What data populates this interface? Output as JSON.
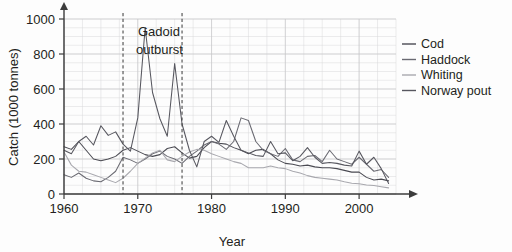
{
  "chart_data": {
    "type": "line",
    "title": "",
    "xlabel": "Year",
    "ylabel": "Catch (1000 tonnes)",
    "xlim": [
      1960,
      2005
    ],
    "ylim": [
      0,
      1000
    ],
    "grid": true,
    "legend_position": "right",
    "x_ticks": [
      "1960",
      "1970",
      "1980",
      "1990",
      "2000"
    ],
    "x_tick_values": [
      1960,
      1970,
      1980,
      1990,
      2000
    ],
    "y_ticks": [
      "0",
      "200",
      "400",
      "600",
      "800",
      "1000"
    ],
    "y_tick_values": [
      0,
      200,
      400,
      600,
      800,
      1000
    ],
    "annotations": [
      {
        "name": "gadoid-outburst",
        "text_line1": "Gadoid",
        "text_line2": "outburst",
        "span_start_year": 1968,
        "span_end_year": 1976,
        "style": "vertical dashed lines"
      }
    ],
    "x": [
      1960,
      1961,
      1962,
      1963,
      1964,
      1965,
      1966,
      1967,
      1968,
      1969,
      1970,
      1971,
      1972,
      1973,
      1974,
      1975,
      1976,
      1977,
      1978,
      1979,
      1980,
      1981,
      1982,
      1983,
      1984,
      1985,
      1986,
      1987,
      1988,
      1989,
      1990,
      1991,
      1992,
      1993,
      1994,
      1995,
      1996,
      1997,
      1998,
      1999,
      2000,
      2001,
      2002,
      2003,
      2004
    ],
    "series": [
      {
        "name": "Cod",
        "color": "#4a4a52",
        "values": [
          270,
          255,
          300,
          250,
          200,
          190,
          200,
          215,
          250,
          265,
          245,
          225,
          215,
          225,
          260,
          270,
          235,
          205,
          215,
          265,
          300,
          290,
          285,
          265,
          250,
          230,
          250,
          255,
          230,
          195,
          175,
          170,
          160,
          165,
          155,
          150,
          150,
          145,
          135,
          125,
          125,
          95,
          80,
          85,
          75
        ]
      },
      {
        "name": "Haddock",
        "color": "#6a6a72",
        "values": [
          110,
          95,
          120,
          90,
          75,
          70,
          95,
          130,
          210,
          195,
          175,
          200,
          230,
          245,
          215,
          200,
          175,
          215,
          245,
          280,
          300,
          285,
          255,
          300,
          435,
          420,
          300,
          250,
          230,
          215,
          260,
          195,
          185,
          215,
          220,
          185,
          250,
          200,
          185,
          170,
          210,
          170,
          130,
          140,
          95
        ]
      },
      {
        "name": "Whiting",
        "color": "#a8a8ae",
        "values": [
          240,
          165,
          130,
          125,
          110,
          95,
          80,
          65,
          90,
          130,
          175,
          205,
          235,
          250,
          195,
          185,
          215,
          240,
          255,
          250,
          230,
          215,
          200,
          185,
          175,
          150,
          150,
          150,
          160,
          150,
          145,
          130,
          120,
          105,
          95,
          90,
          85,
          80,
          70,
          62,
          58,
          52,
          48,
          42,
          35
        ]
      },
      {
        "name": "Norway pout",
        "color": "#57575f",
        "values": [
          250,
          230,
          300,
          330,
          280,
          390,
          335,
          355,
          285,
          245,
          435,
          950,
          580,
          430,
          330,
          745,
          400,
          250,
          155,
          300,
          330,
          295,
          420,
          330,
          250,
          235,
          220,
          215,
          300,
          230,
          235,
          190,
          215,
          265,
          210,
          175,
          180,
          175,
          165,
          160,
          245,
          170,
          210,
          145,
          60
        ]
      }
    ]
  },
  "legend": {
    "items": [
      {
        "label": "Cod"
      },
      {
        "label": "Haddock"
      },
      {
        "label": "Whiting"
      },
      {
        "label": "Norway pout"
      }
    ]
  }
}
